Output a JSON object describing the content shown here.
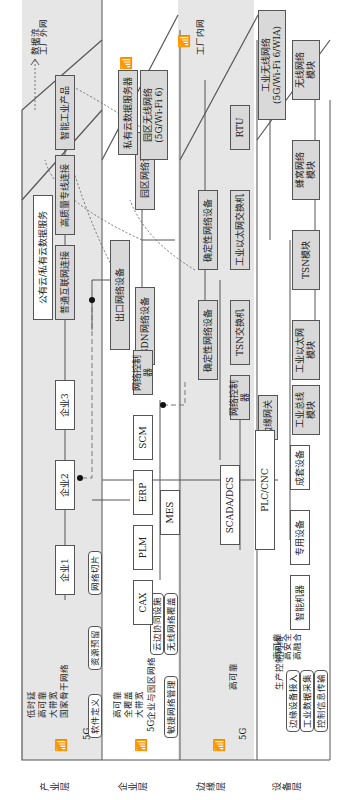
{
  "layers": {
    "industry": {
      "label": "产业层",
      "network_label": "国家骨干网络",
      "features": [
        "低时延",
        "高可靠",
        "大带宽"
      ],
      "tech": "5G",
      "services": [
        "软件定义",
        "资源预留",
        "网络切片"
      ]
    },
    "enterprise": {
      "label": "企业层",
      "network_label": "5G企业与园区网络",
      "features": [
        "高可靠",
        "全覆盖",
        "大带宽"
      ],
      "tech": "5G",
      "services": [
        "敏捷网络管理",
        "无线网络覆盖",
        "云边协同设施"
      ]
    },
    "edge": {
      "label": "边缘层",
      "tech": "5G"
    },
    "device": {
      "label": "设备层",
      "network_label": "生产控制网络",
      "features": [
        "高可靠",
        "高安全",
        "高融合"
      ],
      "services": [
        "边缘设备接入",
        "工业数据采集",
        "控制信息传输"
      ]
    }
  },
  "zones": {
    "factory_outer": "工厂外网",
    "factory_inner": "工厂内网"
  },
  "legend": {
    "data_flow": "数据流"
  },
  "industry_nodes": {
    "enterprise1": "企业1",
    "enterprise2": "企业2",
    "enterprise3": "企业3",
    "cloud_service": "公有云/私有云数据服务",
    "internet_conn": "普通互联网连接",
    "leased_line": "高质量专线连接",
    "smart_product": "智能工业产品"
  },
  "enterprise_nodes": {
    "egress": "出口网络设备",
    "campus_net": "园区网络设备",
    "sdn": "SDN网络设备",
    "net_controller": "网络控制器",
    "private_cloud": "私有云数据服务器",
    "campus_wireless": "园区无线网络\n(5G/Wi-Fi 6)",
    "apps": [
      "CAX",
      "PLM",
      "ERP",
      "SCM"
    ],
    "mes": "MES"
  },
  "edge_nodes": {
    "det_net_1": "确定性网络设备",
    "det_net_2": "确定性网络设备",
    "ind_eth_switch": "工业以太网交换机",
    "tsn_switch": "TSN交换机",
    "net_controller": "网络控制器",
    "edge_gateway": "边缘网关",
    "rtu": "RTU",
    "scada": "SCADA/DCS",
    "plc": "PLC/CNC"
  },
  "device_nodes": {
    "ind_wireless": "工业无线网络\n(5G/Wi-Fi 6/WIA)",
    "wireless_module": "无线网络\n模块",
    "cellular_module": "蜂窝网络\n模块",
    "tsn_module": "TSN模块",
    "ind_eth_module": "工业以太网\n模块",
    "fieldbus_module": "工业总线\n模块",
    "devices": [
      "成套设备",
      "专用设备",
      "智能机器"
    ]
  }
}
